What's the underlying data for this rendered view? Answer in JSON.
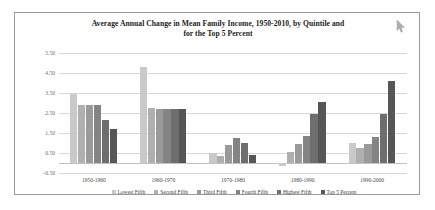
{
  "chart_data": {
    "type": "bar",
    "title": "Average Annual Change in Mean Family Income, 1950-2010, by Quintile and for the Top 5 Percent",
    "title_line1": "Average Annual Change in Mean Family Income, 1950-2010, by Quintile and",
    "title_line2": "for the Top 5 Percent",
    "xlabel": "",
    "ylabel": "",
    "ylim": [
      -0.5,
      5.5
    ],
    "yticks": [
      "5.50",
      "4.50",
      "3.50",
      "2.50",
      "1.50",
      "0.50",
      "-0.50"
    ],
    "ytick_values": [
      5.5,
      4.5,
      3.5,
      2.5,
      1.5,
      0.5,
      -0.5
    ],
    "grid": true,
    "legend_position": "bottom",
    "categories": [
      "1950-1960",
      "1960-1970",
      "1970-1980",
      "1980-1990",
      "1990-2000"
    ],
    "series": [
      {
        "name": "Lowest Fifth",
        "color": "#c9c9c9",
        "values": [
          3.45,
          4.8,
          0.5,
          -0.15,
          1.0
        ]
      },
      {
        "name": "Second Fifth",
        "color": "#b0b0b0",
        "values": [
          2.9,
          2.75,
          0.35,
          0.55,
          0.75
        ]
      },
      {
        "name": "Third Fifth",
        "color": "#9a9a9a",
        "values": [
          2.9,
          2.7,
          0.9,
          0.95,
          0.95
        ]
      },
      {
        "name": "Fourth Fifth",
        "color": "#848484",
        "values": [
          2.9,
          2.7,
          1.25,
          1.35,
          1.3
        ]
      },
      {
        "name": "Highest Fifth",
        "color": "#6e6e6e",
        "values": [
          2.15,
          2.7,
          1.0,
          2.45,
          2.45
        ]
      },
      {
        "name": "Top 5 Percent",
        "color": "#565656",
        "values": [
          1.7,
          2.7,
          0.4,
          3.05,
          4.1
        ]
      }
    ]
  },
  "legend": {
    "items": [
      {
        "label": "Lowest Fifth",
        "color": "#c9c9c9"
      },
      {
        "label": "Second Fifth",
        "color": "#b0b0b0"
      },
      {
        "label": "Third Fifth",
        "color": "#9a9a9a"
      },
      {
        "label": "Fourth Fifth",
        "color": "#848484"
      },
      {
        "label": "Highest Fifth",
        "color": "#6e6e6e"
      },
      {
        "label": "Top 5 Percent",
        "color": "#565656"
      }
    ]
  },
  "colors": {
    "frame": "#9a9a9a",
    "gridline": "#d8d8d8",
    "background": "#ffffff",
    "title_text": "#1c1c1c",
    "tick_text": "#6b6b6b"
  }
}
